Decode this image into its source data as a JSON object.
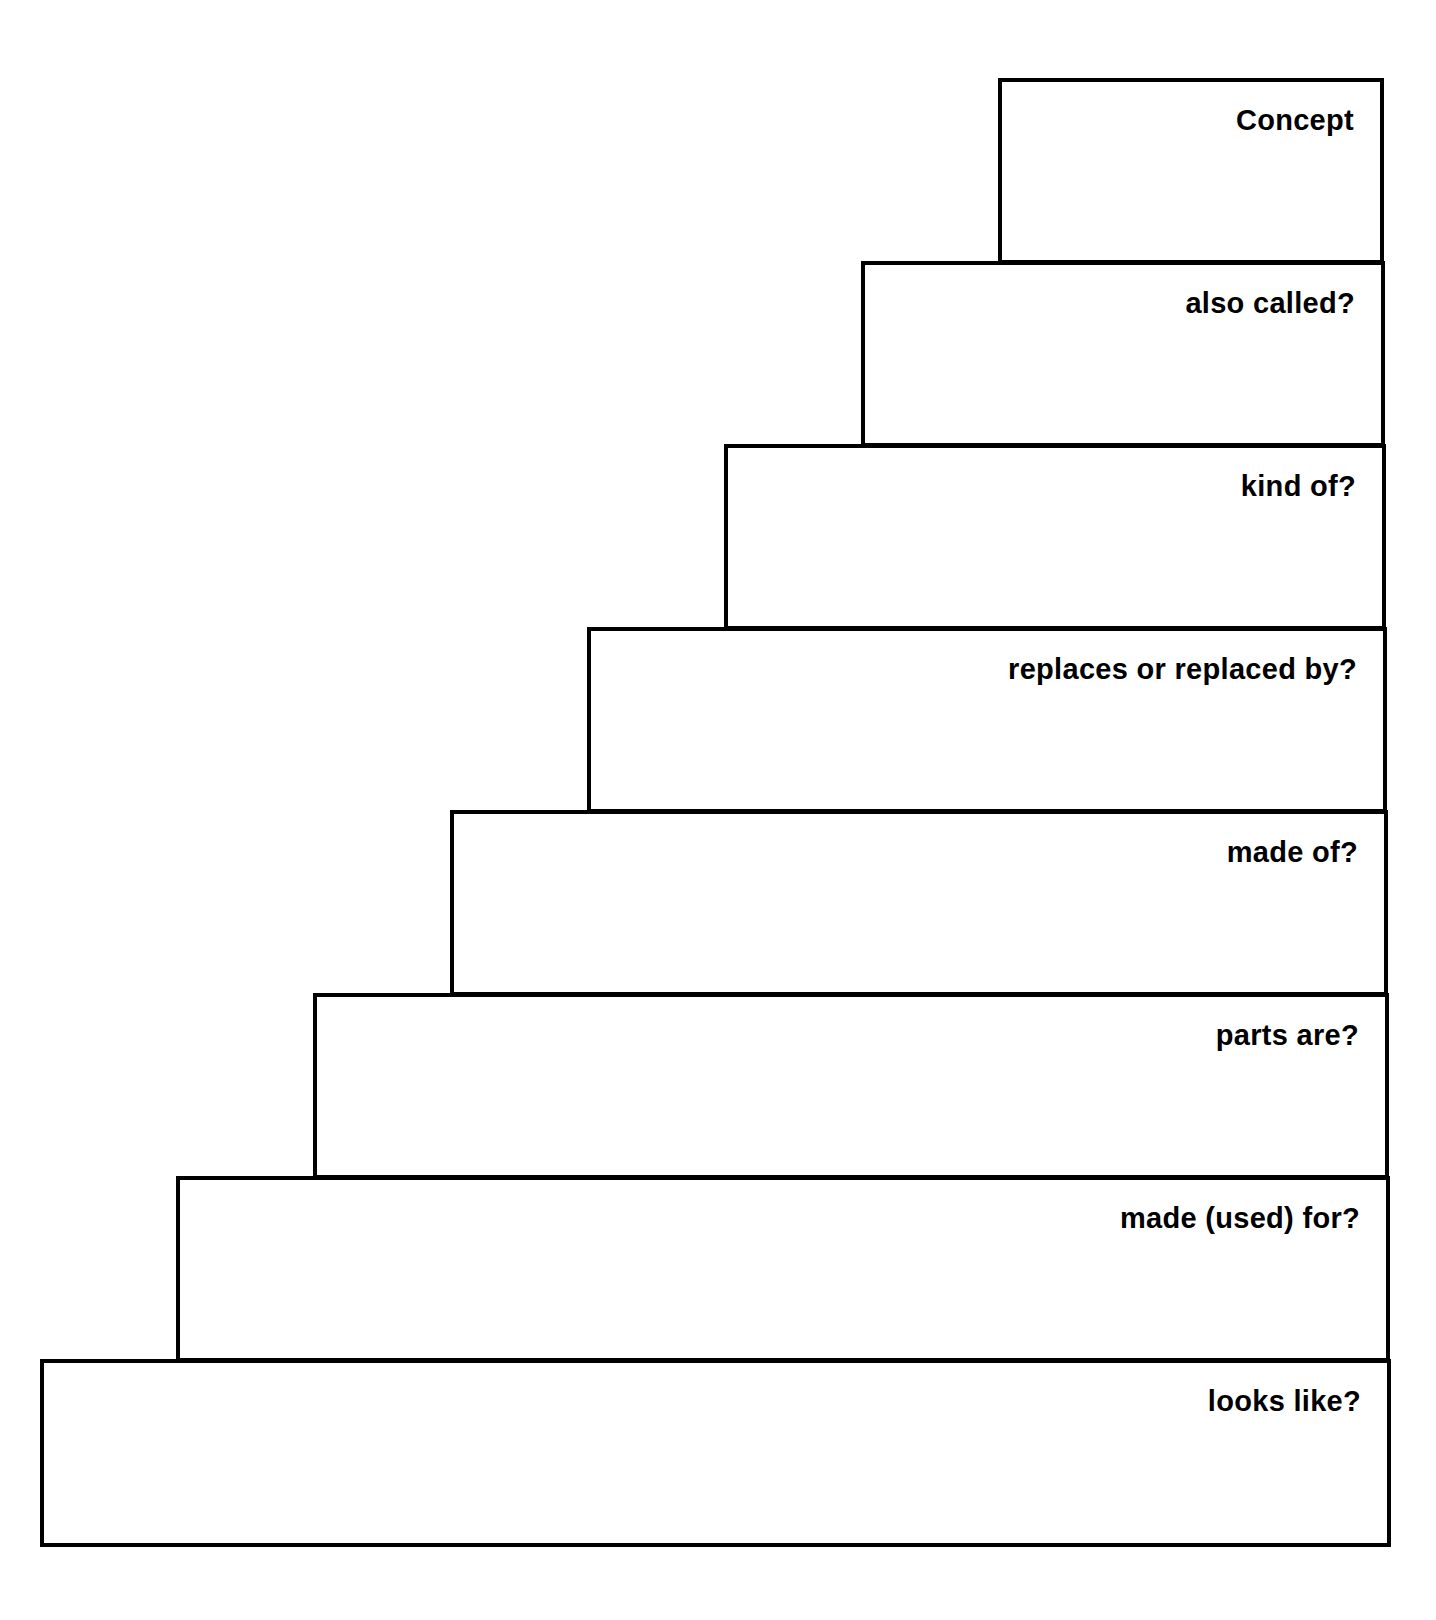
{
  "diagram": {
    "type": "staircase-organizer",
    "steps": [
      {
        "label": "Concept"
      },
      {
        "label": "also called?"
      },
      {
        "label": "kind of?"
      },
      {
        "label": "replaces or replaced by?"
      },
      {
        "label": "made of?"
      },
      {
        "label": "parts are?"
      },
      {
        "label": "made (used) for?"
      },
      {
        "label": "looks like?"
      }
    ],
    "colors": {
      "line": "#000000",
      "background": "#ffffff"
    }
  }
}
